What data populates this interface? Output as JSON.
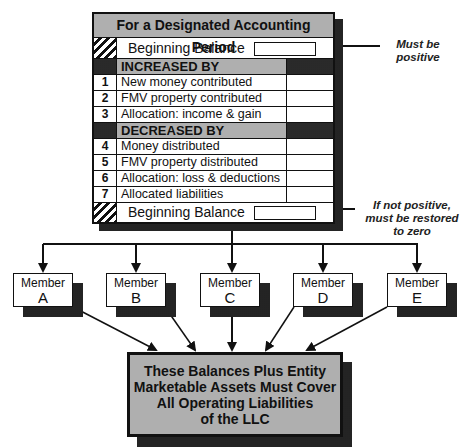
{
  "table": {
    "title": "For a Designated Accounting Period",
    "beginning_balance_top": "Beginning Balance",
    "increased_header": "INCREASED BY",
    "increased_items": [
      {
        "num": "1",
        "label": "New money contributed"
      },
      {
        "num": "2",
        "label": "FMV property contributed"
      },
      {
        "num": "3",
        "label": "Allocation: income & gain"
      }
    ],
    "decreased_header": "DECREASED BY",
    "decreased_items": [
      {
        "num": "4",
        "label": "Money distributed"
      },
      {
        "num": "5",
        "label": "FMV property distributed"
      },
      {
        "num": "6",
        "label": "Allocation: loss & deductions"
      },
      {
        "num": "7",
        "label": "Allocated liabilities"
      }
    ],
    "beginning_balance_bottom": "Beginning Balance"
  },
  "notes": {
    "top_line1": "Must be",
    "top_line2": "positive",
    "bottom_line1": "If not positive,",
    "bottom_line2": "must be restored",
    "bottom_line3": "to zero"
  },
  "members": [
    {
      "label": "Member",
      "letter": "A"
    },
    {
      "label": "Member",
      "letter": "B"
    },
    {
      "label": "Member",
      "letter": "C"
    },
    {
      "label": "Member",
      "letter": "D"
    },
    {
      "label": "Member",
      "letter": "E"
    }
  ],
  "result": {
    "line1": "These Balances Plus Entity",
    "line2": "Marketable Assets Must Cover",
    "line3": "All Operating Liabilities",
    "line4": "of the LLC"
  }
}
